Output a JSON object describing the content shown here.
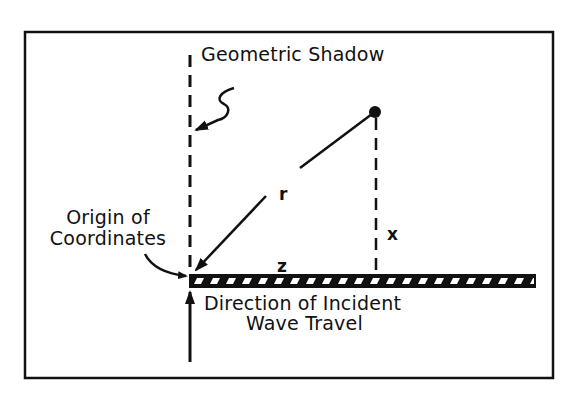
{
  "diagram": {
    "labels": {
      "geometric_shadow": "Geometric Shadow",
      "origin_line1": "Origin of",
      "origin_line2": "Coordinates",
      "direction_line1": "Direction of Incident",
      "direction_line2": "Wave Travel"
    },
    "variables": {
      "r": "r",
      "x": "x",
      "z": "z"
    },
    "colors": {
      "ink": "#111111",
      "background": "#ffffff"
    }
  }
}
